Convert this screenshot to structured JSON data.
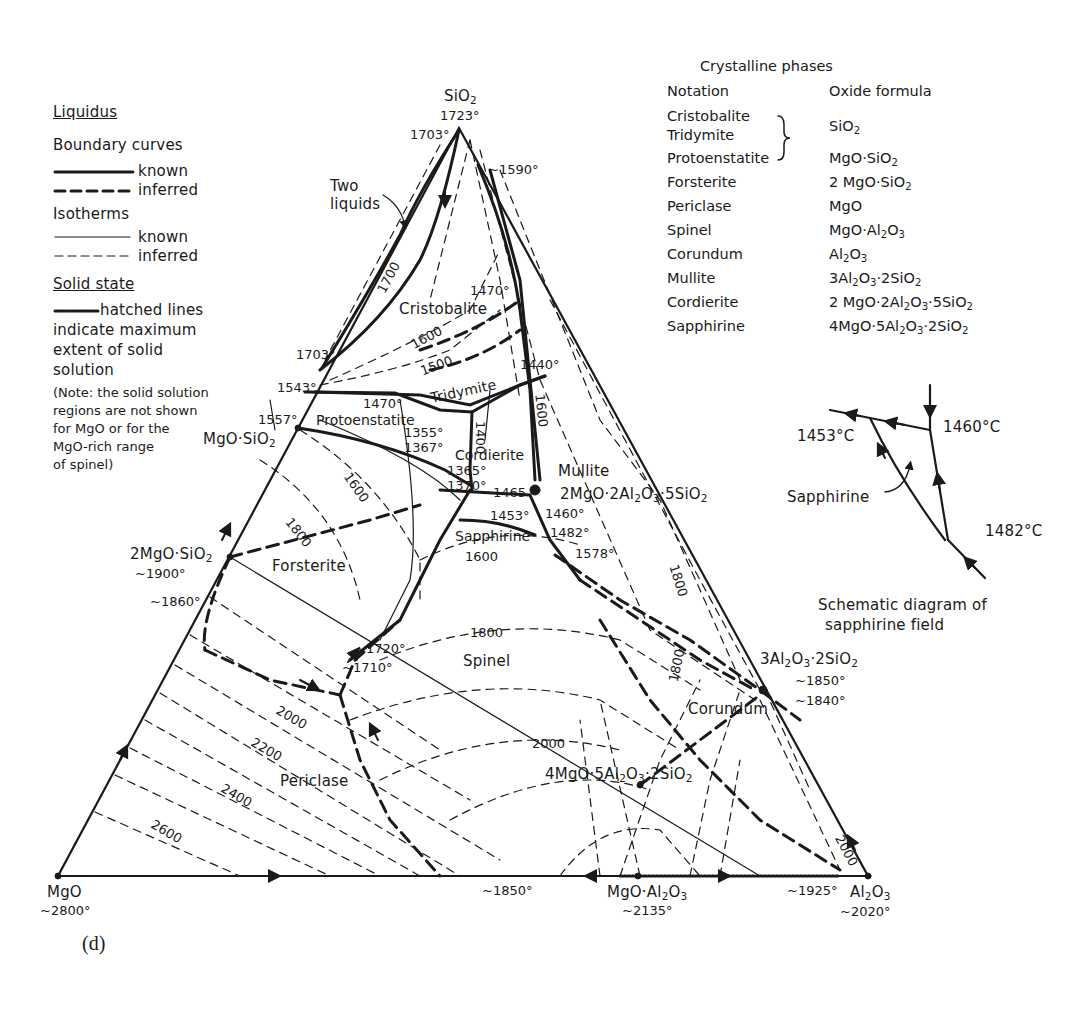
{
  "figure_label": "(d)",
  "legend": {
    "liquidus_title": "Liquidus",
    "boundary_curves_title": "Boundary curves",
    "boundary_known": "known",
    "boundary_inferred": "inferred",
    "isotherms_title": "Isotherms",
    "isotherm_known": "known",
    "isotherm_inferred": "inferred",
    "solid_state_title": "Solid state",
    "solid_state_lines": [
      "hatched lines",
      "indicate maximum",
      "extent of solid",
      "solution"
    ],
    "note_lines": [
      "(Note: the solid solution",
      "regions are not shown",
      "for MgO or for the",
      "MgO-rich range",
      "of spinel)"
    ]
  },
  "phases_table": {
    "title": "Crystalline phases",
    "header_notation": "Notation",
    "header_formula": "Oxide formula",
    "rows": [
      {
        "notation": "Cristobalite",
        "notation2": "Tridymite",
        "formula": "SiO2"
      },
      {
        "notation": "Protoenstatite",
        "formula": "MgO·SiO2"
      },
      {
        "notation": "Forsterite",
        "formula": "2 MgO·SiO2"
      },
      {
        "notation": "Periclase",
        "formula": "MgO"
      },
      {
        "notation": "Spinel",
        "formula": "MgO·Al2O3"
      },
      {
        "notation": "Corundum",
        "formula": "Al2O3"
      },
      {
        "notation": "Mullite",
        "formula": "3Al2O3·2SiO2"
      },
      {
        "notation": "Cordierite",
        "formula": "2 MgO·2Al2O3·5SiO2"
      },
      {
        "notation": "Sapphirine",
        "formula": "4MgO·5Al2O3·2SiO2"
      }
    ]
  },
  "inset": {
    "caption_line1": "Schematic diagram of",
    "caption_line2": "sapphirine field",
    "label_field": "Sapphirine",
    "t1": "1453°C",
    "t2": "1460°C",
    "t3": "1482°C"
  },
  "vertices": {
    "top": {
      "name": "SiO2",
      "temp": "1723°"
    },
    "left": {
      "name": "MgO",
      "temp": "~2800°"
    },
    "right": {
      "name": "Al2O3",
      "temp": "~2020°"
    }
  },
  "compounds": {
    "enstatite": {
      "name": "MgO·SiO2"
    },
    "forsterite": {
      "name": "2MgO·SiO2",
      "temp": "~1900°"
    },
    "spinel": {
      "name": "MgO·Al2O3",
      "temp": "~2135°"
    },
    "mullite": {
      "name": "3Al2O3·2SiO2",
      "temp1": "~1850°",
      "temp2": "~1840°"
    },
    "cordierite": {
      "name": "2MgO·2Al2O3·5SiO2"
    },
    "sapphirine": {
      "name": "4MgO·5Al2O3·2SiO2"
    }
  },
  "field_labels": {
    "cristobalite": "Cristobalite",
    "tridymite": "Tridymite",
    "protoenstatite": "Protoenstatite",
    "cordierite": "Cordierite",
    "mullite": "Mullite",
    "sapphirine": "Sapphirine",
    "forsterite": "Forsterite",
    "spinel": "Spinel",
    "periclase": "Periclase",
    "corundum": "Corundum",
    "two_liquids_1": "Two",
    "two_liquids_2": "liquids"
  },
  "temperatures": {
    "t1703_top": "1703°",
    "t1590": "~1590°",
    "t1470_top": "1470°",
    "t1703_left": "1703°",
    "t1543": "1543°",
    "t1557": "1557°",
    "t1470_mid": "1470°",
    "t1440": "1440°",
    "t1355": "1355°",
    "t1367": "1367°",
    "t1365": "1365°",
    "t1370": "1370°",
    "t1465": "1465",
    "t1453": "1453°",
    "t1460": "1460°",
    "t1482": "1482°",
    "t1578": "1578°",
    "t1860": "~1860°",
    "t1720": "~1720°",
    "t1710": "~1710°",
    "t1850_base": "~1850°",
    "t1925": "~1925°"
  },
  "isotherm_labels": {
    "i1700": "1700",
    "i1600_crist": "1600",
    "i1500": "1500",
    "i1400": "1400",
    "i1600_right": "1600",
    "i1600_forst": "1600",
    "i1800_forst": "1800",
    "i1600_sapph": "1600",
    "i1800_spinel": "1800",
    "i1800_right": "1800",
    "i1800_cor": "1800",
    "i2000_peri": "2000",
    "i2200": "2200",
    "i2400": "2400",
    "i2600": "2600",
    "i2000_spinel": "2000",
    "i2000_cor": "2000"
  }
}
